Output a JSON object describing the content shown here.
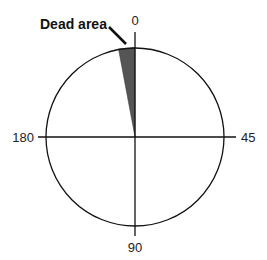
{
  "diagram": {
    "title": "",
    "callout_label": "Dead area",
    "angle_labels": {
      "top": "0",
      "right": "45",
      "bottom": "90",
      "left": "180"
    },
    "colors": {
      "line": "#111111",
      "dead_area_fill": "#555555",
      "background": "#ffffff"
    }
  }
}
